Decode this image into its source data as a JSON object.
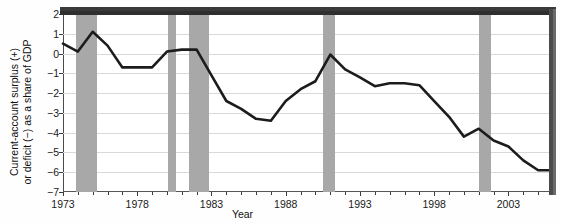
{
  "axis": {
    "y_title_line1": "Current-account surplus (+)",
    "y_title_line2": "or deficit (−) as a share of GDP",
    "x_title": "Year",
    "y_ticks": [
      "2",
      "1",
      "0",
      "−1",
      "−2",
      "−3",
      "−4",
      "−5",
      "−6",
      "−7"
    ],
    "x_ticks": [
      "1973",
      "1978",
      "1983",
      "1988",
      "1993",
      "1998",
      "2003"
    ]
  },
  "colors": {
    "line": "#1c1c1c",
    "recession_band": "#a8a8a8",
    "gridline": "#d9d9d9",
    "frame": "#3a3a3a",
    "background": "#ffffff"
  },
  "chart_data": {
    "type": "line",
    "title": "",
    "subtitle": "",
    "xlabel": "Year",
    "ylabel": "Current-account surplus (+) or deficit (−) as a share of GDP",
    "xlim": [
      1973,
      2006
    ],
    "ylim": [
      -7,
      2
    ],
    "ytick_values": [
      2,
      1,
      0,
      -1,
      -2,
      -3,
      -4,
      -5,
      -6,
      -7
    ],
    "xtick_values": [
      1973,
      1978,
      1983,
      1988,
      1993,
      1998,
      2003
    ],
    "minor_xticks": "every year",
    "grid": "horizontal",
    "legend": "none",
    "series": [
      {
        "name": "Current-account balance as a share of GDP",
        "x": [
          1973,
          1974,
          1975,
          1976,
          1977,
          1978,
          1979,
          1980,
          1981,
          1982,
          1983,
          1984,
          1985,
          1986,
          1987,
          1988,
          1989,
          1990,
          1991,
          1992,
          1993,
          1994,
          1995,
          1996,
          1997,
          1998,
          1999,
          2000,
          2001,
          2002,
          2003,
          2004,
          2005,
          2006
        ],
        "values": [
          0.5,
          0.1,
          1.1,
          0.4,
          -0.7,
          -0.7,
          -0.7,
          0.1,
          0.2,
          0.2,
          -1.1,
          -2.4,
          -2.8,
          -3.3,
          -3.4,
          -2.4,
          -1.8,
          -1.4,
          -0.05,
          -0.8,
          -1.2,
          -1.65,
          -1.5,
          -1.5,
          -1.6,
          -2.4,
          -3.2,
          -4.2,
          -3.8,
          -4.4,
          -4.7,
          -5.4,
          -5.9,
          -5.9
        ]
      }
    ],
    "shaded_regions": [
      {
        "label": "recession",
        "start": 1973.9,
        "end": 1975.3
      },
      {
        "label": "recession",
        "start": 1980.1,
        "end": 1980.6
      },
      {
        "label": "recession",
        "start": 1981.5,
        "end": 1982.8
      },
      {
        "label": "recession",
        "start": 1990.5,
        "end": 1991.3
      },
      {
        "label": "recession",
        "start": 2001.0,
        "end": 2001.8
      }
    ]
  }
}
